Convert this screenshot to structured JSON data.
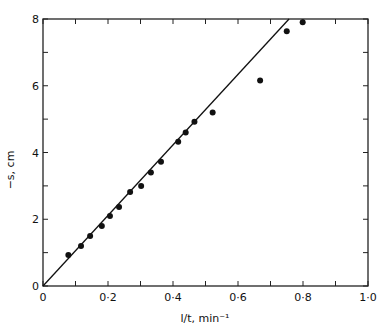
{
  "chart_data": {
    "type": "scatter",
    "title": "",
    "xlabel": "l/t, min⁻¹",
    "ylabel": "−s, cm",
    "xlim": [
      0,
      1.0
    ],
    "ylim": [
      0,
      8
    ],
    "grid": false,
    "legend": null,
    "x_ticks": [
      0,
      0.1,
      0.2,
      0.3,
      0.4,
      0.5,
      0.6,
      0.7,
      0.8,
      0.9,
      1.0
    ],
    "x_tick_labels": [
      {
        "value": 0,
        "label": "0"
      },
      {
        "value": 0.2,
        "label": "0·2"
      },
      {
        "value": 0.4,
        "label": "0·4"
      },
      {
        "value": 0.6,
        "label": "0·6"
      },
      {
        "value": 0.8,
        "label": "0·8"
      },
      {
        "value": 1.0,
        "label": "1·0"
      }
    ],
    "y_ticks": [
      0,
      1,
      2,
      3,
      4,
      5,
      6,
      7,
      8
    ],
    "y_tick_labels": [
      {
        "value": 0,
        "label": "0"
      },
      {
        "value": 2,
        "label": "2"
      },
      {
        "value": 4,
        "label": "4"
      },
      {
        "value": 6,
        "label": "6"
      },
      {
        "value": 8,
        "label": "8"
      }
    ],
    "series": [
      {
        "name": "measured",
        "type": "scatter",
        "marker": "filled-circle",
        "color": "#111111",
        "points": [
          {
            "x": 0.078,
            "y": 0.93
          },
          {
            "x": 0.117,
            "y": 1.2
          },
          {
            "x": 0.145,
            "y": 1.5
          },
          {
            "x": 0.181,
            "y": 1.8
          },
          {
            "x": 0.206,
            "y": 2.1
          },
          {
            "x": 0.234,
            "y": 2.37
          },
          {
            "x": 0.268,
            "y": 2.82
          },
          {
            "x": 0.302,
            "y": 3.0
          },
          {
            "x": 0.332,
            "y": 3.4
          },
          {
            "x": 0.363,
            "y": 3.72
          },
          {
            "x": 0.416,
            "y": 4.32
          },
          {
            "x": 0.439,
            "y": 4.6
          },
          {
            "x": 0.466,
            "y": 4.92
          },
          {
            "x": 0.522,
            "y": 5.2
          },
          {
            "x": 0.668,
            "y": 6.16
          },
          {
            "x": 0.75,
            "y": 7.63
          },
          {
            "x": 0.799,
            "y": 7.9
          }
        ]
      },
      {
        "name": "fit",
        "type": "line",
        "color": "#111111",
        "points": [
          {
            "x": 0,
            "y": 0
          },
          {
            "x": 0.757,
            "y": 8.0
          }
        ]
      }
    ]
  },
  "layout": {
    "plot": {
      "left": 43,
      "right": 368,
      "top": 19,
      "bottom": 286
    }
  }
}
